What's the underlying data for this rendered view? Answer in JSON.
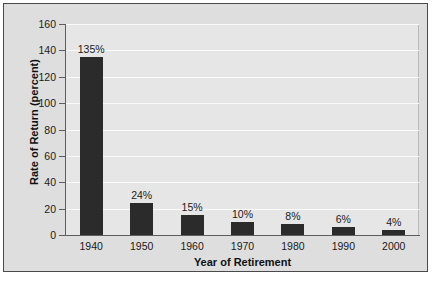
{
  "chart_data": {
    "type": "bar",
    "title": "",
    "xlabel": "Year of Retirement",
    "ylabel": "Rate of Return (percent)",
    "categories": [
      "1940",
      "1950",
      "1960",
      "1970",
      "1980",
      "1990",
      "2000"
    ],
    "values": [
      135,
      24,
      15,
      10,
      8,
      6,
      4
    ],
    "data_labels": [
      "135%",
      "24%",
      "15%",
      "10%",
      "8%",
      "6%",
      "4%"
    ],
    "ylim": [
      0,
      160
    ],
    "yticks": [
      0,
      20,
      40,
      60,
      80,
      100,
      120,
      140,
      160
    ],
    "ytick_labels": [
      "0",
      "20",
      "40",
      "60",
      "80",
      "100",
      "120",
      "140",
      "160"
    ],
    "grid": "horizontal",
    "legend": "none",
    "colors": {
      "bar": "#2b2b2b",
      "plot_background": "#e6e6e6",
      "figure_background": "#dedede",
      "gridline": "#fbfbfb",
      "axis": "#5d5d5d",
      "border": "#4a4a4a",
      "text": "#101010"
    }
  }
}
